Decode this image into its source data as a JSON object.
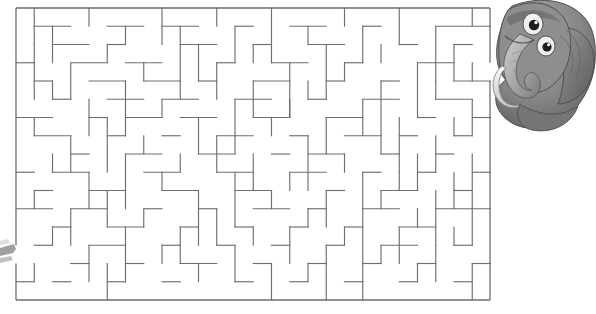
{
  "page": {
    "kind": "maze-puzzle-worksheet",
    "background_color": "#ffffff",
    "width": 596,
    "height": 314
  },
  "maze": {
    "name": "rectangular-grid-maze",
    "line_color": "#6e6e6e",
    "origin_x": 16,
    "origin_y": 8,
    "cell": 18.25,
    "cols": 26,
    "rows": 16,
    "border": {
      "left": 16,
      "top": 8,
      "right": 490,
      "bottom": 300
    },
    "entrance": {
      "side": "left",
      "row": 13
    },
    "exit": {
      "side": "right",
      "row": 3
    },
    "h_walls": [
      [
        1,
        1,
        3
      ],
      [
        5,
        1,
        7
      ],
      [
        8,
        1,
        10
      ],
      [
        12,
        1,
        13
      ],
      [
        15,
        1,
        17
      ],
      [
        19,
        1,
        20
      ],
      [
        23,
        1,
        26
      ],
      [
        2,
        2,
        4
      ],
      [
        5,
        2,
        6
      ],
      [
        9,
        2,
        11
      ],
      [
        13,
        2,
        14
      ],
      [
        16,
        2,
        18
      ],
      [
        21,
        2,
        22
      ],
      [
        24,
        2,
        25
      ],
      [
        0,
        3,
        1
      ],
      [
        3,
        3,
        5
      ],
      [
        6,
        3,
        8
      ],
      [
        11,
        3,
        12
      ],
      [
        14,
        3,
        16
      ],
      [
        18,
        3,
        19
      ],
      [
        22,
        3,
        24
      ],
      [
        1,
        4,
        2
      ],
      [
        4,
        4,
        6
      ],
      [
        7,
        4,
        9
      ],
      [
        10,
        4,
        11
      ],
      [
        13,
        4,
        15
      ],
      [
        17,
        4,
        18
      ],
      [
        20,
        4,
        21
      ],
      [
        24,
        4,
        26
      ],
      [
        2,
        5,
        3
      ],
      [
        5,
        5,
        7
      ],
      [
        8,
        5,
        10
      ],
      [
        12,
        5,
        14
      ],
      [
        16,
        5,
        17
      ],
      [
        19,
        5,
        21
      ],
      [
        23,
        5,
        25
      ],
      [
        0,
        6,
        2
      ],
      [
        4,
        6,
        5
      ],
      [
        6,
        6,
        8
      ],
      [
        9,
        6,
        11
      ],
      [
        13,
        6,
        15
      ],
      [
        17,
        6,
        19
      ],
      [
        22,
        6,
        23
      ],
      [
        25,
        6,
        26
      ],
      [
        1,
        7,
        3
      ],
      [
        5,
        7,
        6
      ],
      [
        8,
        7,
        9
      ],
      [
        11,
        7,
        13
      ],
      [
        15,
        7,
        16
      ],
      [
        18,
        7,
        20
      ],
      [
        21,
        7,
        22
      ],
      [
        24,
        7,
        25
      ],
      [
        3,
        8,
        4
      ],
      [
        6,
        8,
        8
      ],
      [
        10,
        8,
        12
      ],
      [
        14,
        8,
        15
      ],
      [
        16,
        8,
        18
      ],
      [
        20,
        8,
        21
      ],
      [
        23,
        8,
        24
      ],
      [
        0,
        9,
        1
      ],
      [
        2,
        9,
        4
      ],
      [
        7,
        9,
        9
      ],
      [
        11,
        9,
        13
      ],
      [
        15,
        9,
        17
      ],
      [
        19,
        9,
        20
      ],
      [
        22,
        9,
        23
      ],
      [
        25,
        9,
        26
      ],
      [
        1,
        10,
        2
      ],
      [
        4,
        10,
        6
      ],
      [
        8,
        10,
        10
      ],
      [
        12,
        10,
        14
      ],
      [
        17,
        10,
        18
      ],
      [
        20,
        10,
        22
      ],
      [
        24,
        10,
        25
      ],
      [
        0,
        11,
        2
      ],
      [
        3,
        11,
        5
      ],
      [
        7,
        11,
        8
      ],
      [
        10,
        11,
        11
      ],
      [
        13,
        11,
        15
      ],
      [
        16,
        11,
        17
      ],
      [
        19,
        11,
        21
      ],
      [
        23,
        11,
        26
      ],
      [
        2,
        12,
        3
      ],
      [
        5,
        12,
        7
      ],
      [
        9,
        12,
        10
      ],
      [
        12,
        12,
        13
      ],
      [
        15,
        12,
        16
      ],
      [
        18,
        12,
        19
      ],
      [
        21,
        12,
        23
      ],
      [
        1,
        13,
        2
      ],
      [
        4,
        13,
        6
      ],
      [
        8,
        13,
        9
      ],
      [
        11,
        13,
        12
      ],
      [
        14,
        13,
        15
      ],
      [
        17,
        13,
        18
      ],
      [
        20,
        13,
        22
      ],
      [
        24,
        13,
        25
      ],
      [
        3,
        14,
        4
      ],
      [
        6,
        14,
        7
      ],
      [
        9,
        14,
        11
      ],
      [
        13,
        14,
        14
      ],
      [
        16,
        14,
        17
      ],
      [
        19,
        14,
        20
      ],
      [
        22,
        14,
        23
      ],
      [
        25,
        14,
        26
      ],
      [
        0,
        15,
        1
      ],
      [
        2,
        15,
        3
      ],
      [
        5,
        15,
        6
      ],
      [
        8,
        15,
        9
      ],
      [
        12,
        15,
        13
      ],
      [
        15,
        15,
        16
      ],
      [
        18,
        15,
        19
      ],
      [
        21,
        15,
        22
      ],
      [
        24,
        15,
        25
      ]
    ],
    "v_walls": [
      [
        1,
        0,
        2
      ],
      [
        4,
        0,
        1
      ],
      [
        8,
        0,
        2
      ],
      [
        11,
        0,
        1
      ],
      [
        14,
        0,
        3
      ],
      [
        18,
        0,
        1
      ],
      [
        21,
        0,
        2
      ],
      [
        25,
        0,
        1
      ],
      [
        2,
        1,
        2
      ],
      [
        6,
        1,
        1
      ],
      [
        9,
        1,
        3
      ],
      [
        12,
        1,
        2
      ],
      [
        16,
        1,
        1
      ],
      [
        19,
        1,
        2
      ],
      [
        23,
        1,
        3
      ],
      [
        1,
        2,
        3
      ],
      [
        5,
        2,
        1
      ],
      [
        10,
        2,
        2
      ],
      [
        13,
        2,
        1
      ],
      [
        17,
        2,
        3
      ],
      [
        20,
        2,
        1
      ],
      [
        24,
        2,
        2
      ],
      [
        3,
        3,
        2
      ],
      [
        7,
        3,
        1
      ],
      [
        11,
        3,
        2
      ],
      [
        15,
        3,
        3
      ],
      [
        18,
        3,
        1
      ],
      [
        22,
        3,
        2
      ],
      [
        25,
        3,
        1
      ],
      [
        2,
        4,
        1
      ],
      [
        6,
        4,
        3
      ],
      [
        9,
        4,
        1
      ],
      [
        13,
        4,
        2
      ],
      [
        16,
        4,
        1
      ],
      [
        20,
        4,
        3
      ],
      [
        23,
        4,
        1
      ],
      [
        4,
        5,
        2
      ],
      [
        8,
        5,
        1
      ],
      [
        12,
        5,
        3
      ],
      [
        15,
        5,
        1
      ],
      [
        19,
        5,
        2
      ],
      [
        22,
        5,
        1
      ],
      [
        25,
        5,
        2
      ],
      [
        1,
        6,
        1
      ],
      [
        5,
        6,
        3
      ],
      [
        10,
        6,
        2
      ],
      [
        14,
        6,
        1
      ],
      [
        17,
        6,
        2
      ],
      [
        21,
        6,
        3
      ],
      [
        24,
        6,
        1
      ],
      [
        3,
        7,
        2
      ],
      [
        7,
        7,
        1
      ],
      [
        11,
        7,
        2
      ],
      [
        16,
        7,
        3
      ],
      [
        20,
        7,
        1
      ],
      [
        23,
        7,
        2
      ],
      [
        2,
        8,
        1
      ],
      [
        6,
        8,
        3
      ],
      [
        9,
        8,
        1
      ],
      [
        13,
        8,
        2
      ],
      [
        18,
        8,
        1
      ],
      [
        22,
        8,
        2
      ],
      [
        25,
        8,
        3
      ],
      [
        4,
        9,
        2
      ],
      [
        8,
        9,
        1
      ],
      [
        12,
        9,
        3
      ],
      [
        15,
        9,
        1
      ],
      [
        19,
        9,
        2
      ],
      [
        21,
        9,
        1
      ],
      [
        24,
        9,
        2
      ],
      [
        1,
        10,
        1
      ],
      [
        5,
        10,
        2
      ],
      [
        10,
        10,
        3
      ],
      [
        14,
        10,
        1
      ],
      [
        17,
        10,
        2
      ],
      [
        20,
        10,
        1
      ],
      [
        23,
        10,
        3
      ],
      [
        3,
        11,
        2
      ],
      [
        7,
        11,
        1
      ],
      [
        11,
        11,
        2
      ],
      [
        16,
        11,
        1
      ],
      [
        19,
        11,
        3
      ],
      [
        22,
        11,
        1
      ],
      [
        25,
        11,
        2
      ],
      [
        2,
        12,
        1
      ],
      [
        6,
        12,
        3
      ],
      [
        9,
        12,
        2
      ],
      [
        13,
        12,
        1
      ],
      [
        15,
        12,
        2
      ],
      [
        18,
        12,
        1
      ],
      [
        21,
        12,
        2
      ],
      [
        24,
        12,
        1
      ],
      [
        4,
        13,
        2
      ],
      [
        8,
        13,
        1
      ],
      [
        12,
        13,
        2
      ],
      [
        17,
        13,
        3
      ],
      [
        20,
        13,
        1
      ],
      [
        23,
        13,
        2
      ],
      [
        1,
        14,
        1
      ],
      [
        5,
        14,
        2
      ],
      [
        10,
        14,
        1
      ],
      [
        14,
        14,
        2
      ],
      [
        16,
        14,
        1
      ],
      [
        19,
        14,
        2
      ],
      [
        22,
        14,
        1
      ],
      [
        25,
        14,
        2
      ]
    ]
  },
  "character": {
    "name": "cartoon-elephant",
    "description": "grayscale cartoon elephant head with trunk, peeking from behind the maze",
    "position": {
      "x": 492,
      "y": 0,
      "width": 104,
      "height": 132
    },
    "colors": {
      "body_dark": "#6b6b6b",
      "body_mid": "#8d8d8d",
      "body_light": "#b4b4b4",
      "highlight": "#d8d8d8",
      "eye_white": "#f2f2f2",
      "eye_pupil": "#1f1f1f",
      "outline": "#4a4a4a"
    }
  },
  "corner_shape": {
    "name": "partial-shape-left-edge",
    "description": "small grey sliver of a second character cut off at the left edge",
    "position": {
      "x": 0,
      "y": 236,
      "width": 16,
      "height": 30
    },
    "color": "#9a9a9a"
  }
}
